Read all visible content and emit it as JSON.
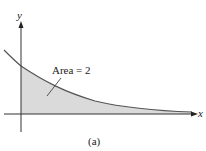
{
  "figure": {
    "caption": "(a)",
    "x_axis_label": "x",
    "y_axis_label": "y",
    "annotation": "Area = 2",
    "colors": {
      "fill": "#d9d9d9",
      "curve": "#555555",
      "axes": "#333333"
    }
  }
}
